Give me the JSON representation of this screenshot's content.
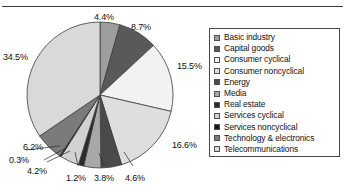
{
  "chart_data": {
    "type": "pie",
    "title": "",
    "subtitle": "",
    "xlabel": "",
    "ylabel": "",
    "legend_position": "right",
    "grid": false,
    "start_angle_deg": 0,
    "direction": "clockwise",
    "units": "percent",
    "total": 100.0,
    "categories": [
      "Basic industry",
      "Capital goods",
      "Consumer cyclical",
      "Consumer noncyclical",
      "Energy",
      "Media",
      "Real estate",
      "Services cyclical",
      "Services noncyclical",
      "Technology & electronics",
      "Telecommunications"
    ],
    "values": [
      4.4,
      8.7,
      15.5,
      16.6,
      4.6,
      3.8,
      1.2,
      4.2,
      0.3,
      6.2,
      34.5
    ],
    "data_labels": [
      "4.4%",
      "8.7%",
      "15.5%",
      "16.6%",
      "4.6%",
      "3.8%",
      "1.2%",
      "4.2%",
      "0.3%",
      "6.2%",
      "34.5%"
    ],
    "colors": [
      "#9d9d9d",
      "#595959",
      "#f2f2f2",
      "#dedede",
      "#4a4a4a",
      "#a8a8a8",
      "#2b2b2b",
      "#d2d2d2",
      "#141414",
      "#7b7b7b",
      "#d9d9d9"
    ],
    "slices": [
      {
        "label": "Basic industry",
        "value": 4.4,
        "data_label": "4.4%",
        "color": "#9d9d9d"
      },
      {
        "label": "Capital goods",
        "value": 8.7,
        "data_label": "8.7%",
        "color": "#595959"
      },
      {
        "label": "Consumer cyclical",
        "value": 15.5,
        "data_label": "15.5%",
        "color": "#f2f2f2"
      },
      {
        "label": "Consumer noncyclical",
        "value": 16.6,
        "data_label": "16.6%",
        "color": "#dedede"
      },
      {
        "label": "Energy",
        "value": 4.6,
        "data_label": "4.6%",
        "color": "#4a4a4a"
      },
      {
        "label": "Media",
        "value": 3.8,
        "data_label": "3.8%",
        "color": "#a8a8a8"
      },
      {
        "label": "Real estate",
        "value": 1.2,
        "data_label": "1.2%",
        "color": "#2b2b2b"
      },
      {
        "label": "Services cyclical",
        "value": 4.2,
        "data_label": "4.2%",
        "color": "#d2d2d2"
      },
      {
        "label": "Services noncyclical",
        "value": 0.3,
        "data_label": "0.3%",
        "color": "#141414"
      },
      {
        "label": "Technology & electronics",
        "value": 6.2,
        "data_label": "6.2%",
        "color": "#7b7b7b"
      },
      {
        "label": "Telecommunications",
        "value": 34.5,
        "data_label": "34.5%",
        "color": "#d9d9d9"
      }
    ]
  },
  "legend": {
    "items": [
      {
        "label": "Basic industry",
        "color": "#9d9d9d"
      },
      {
        "label": "Capital goods",
        "color": "#595959"
      },
      {
        "label": "Consumer cyclical",
        "color": "#f2f2f2"
      },
      {
        "label": "Consumer noncyclical",
        "color": "#dedede"
      },
      {
        "label": "Energy",
        "color": "#4a4a4a"
      },
      {
        "label": "Media",
        "color": "#a8a8a8"
      },
      {
        "label": "Real estate",
        "color": "#2b2b2b"
      },
      {
        "label": "Services cyclical",
        "color": "#d2d2d2"
      },
      {
        "label": "Services noncyclical",
        "color": "#141414"
      },
      {
        "label": "Technology & electronics",
        "color": "#7b7b7b"
      },
      {
        "label": "Telecommunications",
        "color": "#d9d9d9"
      }
    ]
  },
  "geometry": {
    "center_x": 100,
    "center_y": 95,
    "radius": 73,
    "outline_color": "#3d3d3d"
  },
  "labels": [
    {
      "text": "4.4%",
      "x": 94,
      "y": 12,
      "anchor": "start"
    },
    {
      "text": "8.7%",
      "x": 131,
      "y": 22,
      "anchor": "start"
    },
    {
      "text": "15.5%",
      "x": 177,
      "y": 61,
      "anchor": "start"
    },
    {
      "text": "16.6%",
      "x": 172,
      "y": 140,
      "anchor": "start"
    },
    {
      "text": "4.6%",
      "x": 125,
      "y": 173,
      "anchor": "start"
    },
    {
      "text": "3.8%",
      "x": 94,
      "y": 173,
      "anchor": "start"
    },
    {
      "text": "1.2%",
      "x": 66,
      "y": 173,
      "anchor": "start"
    },
    {
      "text": "4.2%",
      "x": 27,
      "y": 166,
      "anchor": "start"
    },
    {
      "text": "0.3%",
      "x": 9,
      "y": 155,
      "anchor": "start"
    },
    {
      "text": "6.2%",
      "x": 23,
      "y": 142,
      "anchor": "start"
    },
    {
      "text": "34.5%",
      "x": 3,
      "y": 52,
      "anchor": "start"
    }
  ],
  "leader_lines": [
    {
      "from_x": 44,
      "from_y": 160,
      "to_x": 66,
      "to_y": 148
    },
    {
      "from_x": 26,
      "from_y": 150,
      "to_x": 60,
      "to_y": 146
    },
    {
      "from_x": 47,
      "from_y": 162,
      "to_x": 70,
      "to_y": 151
    },
    {
      "from_x": 78,
      "from_y": 166,
      "to_x": 75,
      "to_y": 152
    },
    {
      "from_x": 104,
      "from_y": 166,
      "to_x": 99,
      "to_y": 153
    },
    {
      "from_x": 133,
      "from_y": 166,
      "to_x": 124,
      "to_y": 152
    }
  ]
}
